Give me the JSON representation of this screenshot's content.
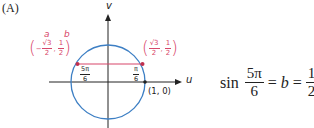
{
  "panel_label": "(A)",
  "axes": {
    "x_label": "u",
    "y_label": "v"
  },
  "point_labels": {
    "a": "a",
    "b": "b",
    "left_point": {
      "sign": "−",
      "x_num": "√3",
      "x_den": "2",
      "comma": ",",
      "y_num": "1",
      "y_den": "2"
    },
    "right_point": {
      "x_num": "√3",
      "x_den": "2",
      "comma": ",",
      "y_num": "1",
      "y_den": "2"
    }
  },
  "angle_labels": {
    "left": {
      "num": "5π",
      "den": "6"
    },
    "right": {
      "num": "π",
      "den": "6"
    }
  },
  "unit_point": "(1, 0)",
  "equation": {
    "func": "sin",
    "arg_num": "5π",
    "arg_den": "6",
    "eq1": "=",
    "var": "b",
    "eq2": "=",
    "val_num": "1",
    "val_den": "2"
  },
  "colors": {
    "circle": "#3d7fc4",
    "accent": "#d8476a",
    "axis": "#222222"
  }
}
